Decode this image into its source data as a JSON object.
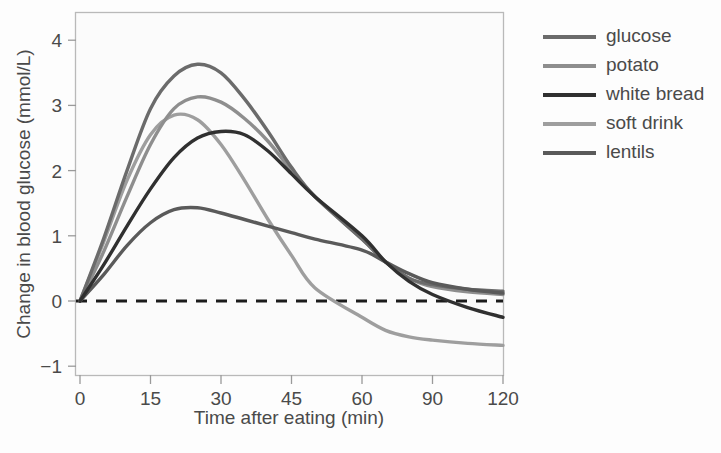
{
  "chart_data": {
    "type": "line",
    "title": "",
    "xlabel": "Time after eating (min)",
    "ylabel": "Change in blood glucose (mmol/L)",
    "xticks": [
      0,
      15,
      30,
      45,
      60,
      90,
      120
    ],
    "xtick_labels": [
      "0",
      "15",
      "30",
      "45",
      "60",
      "90",
      "120"
    ],
    "yticks": [
      -1,
      0,
      1,
      2,
      3,
      4
    ],
    "ytick_labels": [
      "−1",
      "0",
      "1",
      "2",
      "3",
      "4"
    ],
    "xlim": [
      0,
      120
    ],
    "ylim": [
      -1.15,
      4.35
    ],
    "grid": false,
    "legend_position": "right",
    "reference_line": {
      "name": "zero-baseline",
      "value": 0,
      "style": "dashed",
      "color": "#1c1c1c"
    },
    "series": [
      {
        "name": "glucose",
        "color": "#6b6b6b",
        "x": [
          0,
          5,
          10,
          15,
          20,
          25,
          30,
          35,
          40,
          45,
          50,
          60,
          70,
          80,
          90,
          105,
          120
        ],
        "values": [
          0.0,
          0.95,
          2.0,
          2.95,
          3.45,
          3.63,
          3.5,
          3.1,
          2.6,
          2.05,
          1.6,
          0.95,
          0.6,
          0.35,
          0.25,
          0.18,
          0.15
        ]
      },
      {
        "name": "potato",
        "color": "#8e8e8e",
        "x": [
          0,
          5,
          10,
          15,
          20,
          25,
          30,
          35,
          40,
          45,
          50,
          60,
          70,
          80,
          90,
          105,
          120
        ],
        "values": [
          0.0,
          0.75,
          1.6,
          2.4,
          2.95,
          3.13,
          3.05,
          2.8,
          2.45,
          2.0,
          1.6,
          0.95,
          0.6,
          0.35,
          0.22,
          0.14,
          0.1
        ]
      },
      {
        "name": "white bread",
        "color": "#303030",
        "x": [
          0,
          5,
          10,
          15,
          20,
          25,
          30,
          35,
          40,
          45,
          50,
          60,
          70,
          80,
          90,
          105,
          120
        ],
        "values": [
          0.0,
          0.55,
          1.15,
          1.72,
          2.2,
          2.5,
          2.6,
          2.55,
          2.3,
          1.95,
          1.6,
          1.0,
          0.6,
          0.3,
          0.1,
          -0.1,
          -0.25
        ]
      },
      {
        "name": "soft drink",
        "color": "#9e9e9e",
        "x": [
          0,
          5,
          10,
          15,
          20,
          25,
          30,
          35,
          40,
          45,
          50,
          60,
          70,
          80,
          90,
          105,
          120
        ],
        "values": [
          0.0,
          0.9,
          1.85,
          2.55,
          2.85,
          2.78,
          2.4,
          1.85,
          1.25,
          0.7,
          0.2,
          -0.25,
          -0.45,
          -0.55,
          -0.6,
          -0.65,
          -0.68
        ]
      },
      {
        "name": "lentils",
        "color": "#5a5a5a",
        "x": [
          0,
          5,
          10,
          15,
          20,
          25,
          30,
          35,
          40,
          45,
          50,
          60,
          70,
          80,
          90,
          105,
          120
        ],
        "values": [
          0.0,
          0.4,
          0.85,
          1.2,
          1.4,
          1.43,
          1.35,
          1.25,
          1.15,
          1.05,
          0.95,
          0.78,
          0.6,
          0.42,
          0.28,
          0.18,
          0.12
        ]
      }
    ]
  },
  "legend": {
    "items": [
      {
        "label": "glucose"
      },
      {
        "label": "potato"
      },
      {
        "label": "white bread"
      },
      {
        "label": "soft drink"
      },
      {
        "label": "lentils"
      }
    ]
  }
}
